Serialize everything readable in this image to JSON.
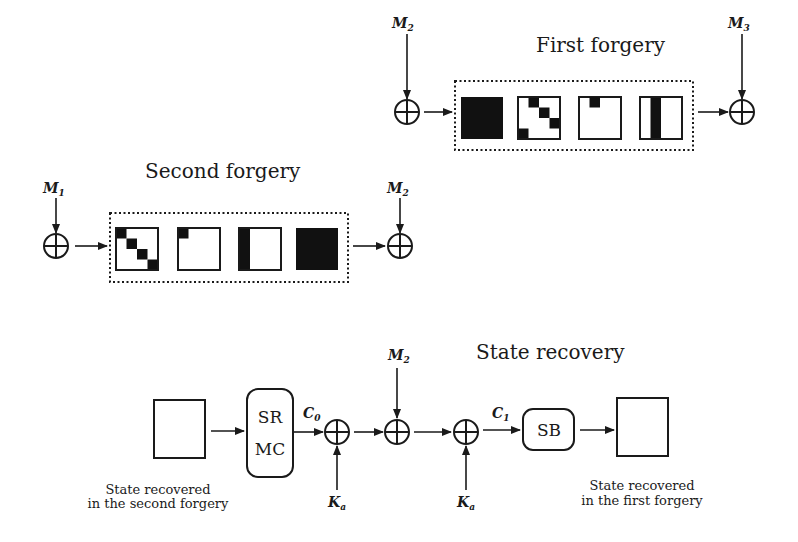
{
  "first_forgery": {
    "title": "First forgery",
    "input_label": {
      "base": "M",
      "sub": "2"
    },
    "output_label": {
      "base": "M",
      "sub": "3"
    },
    "state_patterns": [
      "full-black",
      "diagonal-shifted",
      "single-cell-top",
      "column-black"
    ]
  },
  "second_forgery": {
    "title": "Second forgery",
    "input_label": {
      "base": "M",
      "sub": "1"
    },
    "output_label": {
      "base": "M",
      "sub": "2"
    },
    "state_patterns": [
      "diagonal",
      "single-cell-topleft",
      "column-black-left",
      "full-black"
    ]
  },
  "state_recovery": {
    "title": "State recovery",
    "left_caption": [
      "State recovered",
      "in the second forgery"
    ],
    "right_caption": [
      "State recovered",
      "in the first forgery"
    ],
    "srmc_box": [
      "SR",
      "MC"
    ],
    "sb_box": "SB",
    "c0": {
      "base": "C",
      "sub": "0"
    },
    "c1": {
      "base": "C",
      "sub": "1"
    },
    "m2": {
      "base": "M",
      "sub": "2"
    },
    "ka1": {
      "base": "K",
      "sub": "a"
    },
    "ka2": {
      "base": "K",
      "sub": "a"
    }
  }
}
